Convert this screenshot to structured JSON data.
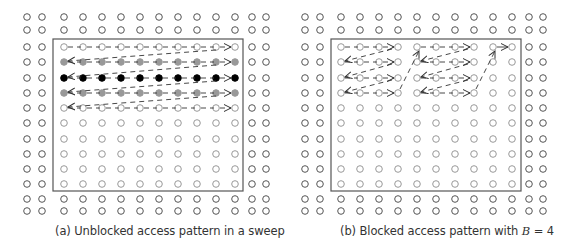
{
  "panels": [
    {
      "id": "a",
      "caption": "(a) Unblocked access pattern in a sweep",
      "outer_cols": [
        27,
        42,
        252,
        266
      ],
      "inner_cols": [
        64,
        83,
        102,
        121,
        140,
        159,
        178,
        197,
        216,
        235
      ],
      "outer_rows": [
        17,
        30,
        199,
        211
      ],
      "inner_rows": [
        47,
        62,
        78,
        93,
        108,
        123,
        139,
        154,
        169,
        184
      ],
      "box": {
        "x": 53,
        "y": 39,
        "w": 190,
        "h": 152
      },
      "highlight_rows": {
        "1": "#999999",
        "2": "#000000",
        "3": "#999999"
      },
      "sweep_rows": [
        0,
        1,
        2,
        3,
        4
      ],
      "blocked": false
    },
    {
      "id": "b",
      "caption_prefix": "(b) Blocked access pattern with ",
      "caption_var": "B",
      "caption_suffix": " = 4",
      "outer_cols": [
        305,
        320,
        529,
        543
      ],
      "inner_cols": [
        341,
        360,
        379,
        398,
        417,
        436,
        455,
        474,
        493,
        512
      ],
      "outer_rows": [
        17,
        30,
        199,
        211
      ],
      "inner_rows": [
        47,
        62,
        78,
        93,
        108,
        123,
        139,
        154,
        169,
        184
      ],
      "box": {
        "x": 331,
        "y": 39,
        "w": 190,
        "h": 152
      },
      "block_size": 4,
      "blocks": [
        {
          "start_col": 0,
          "end_col": 3,
          "rows": [
            0,
            1,
            2,
            3
          ]
        },
        {
          "start_col": 4,
          "end_col": 7,
          "rows": [
            0,
            1,
            2,
            3
          ]
        },
        {
          "start_col": 8,
          "end_col": 9,
          "rows": [
            0
          ]
        }
      ],
      "blocked": true
    }
  ],
  "colors": {
    "outer_point": "#555555",
    "inner_point": "#999999",
    "box_stroke": "#555555",
    "arrow": "#333333"
  }
}
